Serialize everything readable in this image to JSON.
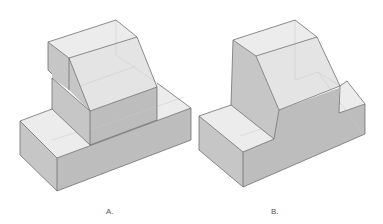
{
  "figure": {
    "colors": {
      "top_face": "#ececec",
      "side_face": "#c6c6c6",
      "front_face": "#bdbdbd",
      "slope_face": "#e4e4e4",
      "edge": "#707070",
      "background": "#ffffff"
    }
  },
  "options": [
    {
      "id": "A",
      "label": "A."
    },
    {
      "id": "B",
      "label": "B."
    }
  ]
}
